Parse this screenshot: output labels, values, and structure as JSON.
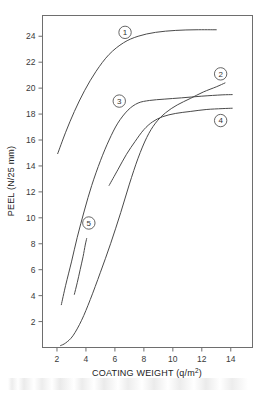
{
  "chart_data": {
    "type": "line",
    "title": "",
    "xlabel": "COATING WEIGHT (q/m²)",
    "xlabel_base": "COATING WEIGHT (q/m",
    "xlabel_sup": "2",
    "xlabel_tail": ")",
    "ylabel": "PEEL (N/25 mm)",
    "xlim": [
      1.0,
      15.5
    ],
    "ylim": [
      0.0,
      25.6
    ],
    "xticks": [
      2,
      4,
      6,
      8,
      10,
      12,
      14
    ],
    "xticklabels": [
      "2",
      "4",
      "6",
      "8",
      "10",
      "12",
      "14"
    ],
    "yticks": [
      2,
      4,
      6,
      8,
      10,
      12,
      14,
      16,
      18,
      20,
      22,
      24
    ],
    "yticklabels": [
      "2",
      "4",
      "6",
      "8",
      "10",
      "12",
      "14",
      "16",
      "18",
      "20",
      "22",
      "24"
    ],
    "grid": false,
    "legend": "inline-numbered-markers",
    "series": [
      {
        "name": "1",
        "label": "1",
        "label_x": 6.7,
        "label_y": 24.3,
        "color": "#8a8a8a",
        "points": [
          [
            2.05,
            14.95
          ],
          [
            2.6,
            16.6
          ],
          [
            3.2,
            18.2
          ],
          [
            3.9,
            19.8
          ],
          [
            4.7,
            21.3
          ],
          [
            5.6,
            22.6
          ],
          [
            6.6,
            23.5
          ],
          [
            7.6,
            24.0
          ],
          [
            8.8,
            24.3
          ],
          [
            10.2,
            24.45
          ],
          [
            11.6,
            24.5
          ],
          [
            13.0,
            24.5
          ]
        ]
      },
      {
        "name": "2",
        "label": "2",
        "label_x": 13.3,
        "label_y": 21.1,
        "color": "#4a4a4a",
        "points": [
          [
            2.25,
            0.15
          ],
          [
            2.6,
            0.35
          ],
          [
            3.1,
            0.9
          ],
          [
            3.7,
            2.1
          ],
          [
            4.3,
            3.7
          ],
          [
            5.0,
            5.8
          ],
          [
            5.7,
            8.0
          ],
          [
            6.4,
            10.4
          ],
          [
            7.0,
            12.6
          ],
          [
            7.6,
            14.6
          ],
          [
            8.2,
            16.2
          ],
          [
            8.8,
            17.3
          ],
          [
            9.5,
            18.1
          ],
          [
            10.3,
            18.7
          ],
          [
            11.2,
            19.2
          ],
          [
            12.1,
            19.7
          ],
          [
            13.0,
            20.1
          ],
          [
            13.6,
            20.4
          ]
        ]
      },
      {
        "name": "3",
        "label": "3",
        "label_x": 6.3,
        "label_y": 19.0,
        "color": "#4a4a4a",
        "points": [
          [
            2.3,
            3.3
          ],
          [
            2.6,
            4.8
          ],
          [
            3.0,
            6.6
          ],
          [
            3.4,
            8.5
          ],
          [
            3.9,
            10.6
          ],
          [
            4.4,
            12.5
          ],
          [
            5.0,
            14.4
          ],
          [
            5.6,
            16.0
          ],
          [
            6.2,
            17.3
          ],
          [
            6.9,
            18.3
          ],
          [
            7.6,
            18.85
          ],
          [
            8.4,
            19.05
          ],
          [
            9.4,
            19.15
          ],
          [
            10.6,
            19.25
          ],
          [
            12.0,
            19.38
          ],
          [
            13.4,
            19.48
          ],
          [
            14.1,
            19.5
          ]
        ]
      },
      {
        "name": "4",
        "label": "4",
        "label_x": 13.3,
        "label_y": 17.5,
        "color": "#4a4a4a",
        "points": [
          [
            5.6,
            12.5
          ],
          [
            6.2,
            13.7
          ],
          [
            6.8,
            14.9
          ],
          [
            7.4,
            15.9
          ],
          [
            8.0,
            16.8
          ],
          [
            8.6,
            17.4
          ],
          [
            9.3,
            17.8
          ],
          [
            10.2,
            18.05
          ],
          [
            11.2,
            18.2
          ],
          [
            12.3,
            18.35
          ],
          [
            13.4,
            18.42
          ],
          [
            14.1,
            18.45
          ]
        ]
      },
      {
        "name": "5",
        "label": "5",
        "label_x": 4.2,
        "label_y": 9.6,
        "color": "#4a4a4a",
        "points": [
          [
            3.2,
            4.1
          ],
          [
            3.4,
            5.0
          ],
          [
            3.6,
            6.0
          ],
          [
            3.8,
            7.0
          ],
          [
            3.95,
            7.9
          ],
          [
            4.05,
            8.4
          ]
        ]
      }
    ]
  }
}
